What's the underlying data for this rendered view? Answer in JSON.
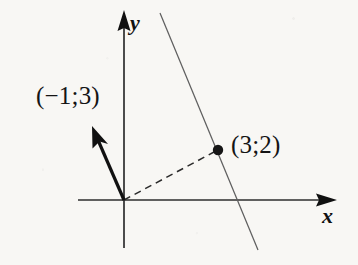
{
  "figure": {
    "kind": "coordinate-plane-vector-diagram",
    "background_color": "#f8f7f4",
    "ink_color": "#141414",
    "thin_line_color": "#5a5a5a",
    "axes": {
      "x_label": "x",
      "y_label": "y",
      "origin": {
        "x": 124,
        "y": 200
      },
      "x_axis": {
        "x1": 78,
        "y1": 200,
        "x2": 337,
        "y2": 200,
        "arrow_at": "end"
      },
      "y_axis": {
        "x1": 124,
        "y1": 248,
        "x2": 124,
        "y2": 10,
        "arrow_at": "end"
      }
    },
    "vector": {
      "label": "(−1;3)",
      "from": {
        "x": 124,
        "y": 200
      },
      "to": {
        "x": 92,
        "y": 126
      },
      "style": "solid-bold-arrow"
    },
    "point": {
      "label": "(3;2)",
      "at": {
        "x": 218,
        "y": 150
      },
      "radius": 5,
      "style": "filled-dot"
    },
    "dashed_segment": {
      "from": {
        "x": 124,
        "y": 200
      },
      "to": {
        "x": 218,
        "y": 150
      },
      "style": "dashed"
    },
    "slanted_line": {
      "from": {
        "x": 160,
        "y": 13
      },
      "to": {
        "x": 258,
        "y": 250
      },
      "style": "thin-solid",
      "passes_through_point": true
    }
  }
}
